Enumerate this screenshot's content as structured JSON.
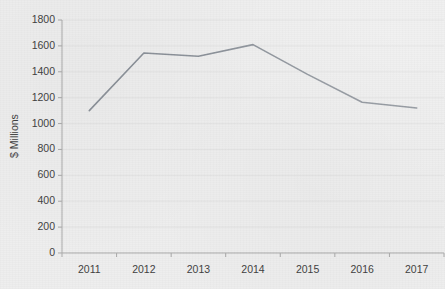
{
  "chart_data": {
    "type": "line",
    "title": "",
    "xlabel": "",
    "ylabel": "$ Millions",
    "categories": [
      "2011",
      "2012",
      "2013",
      "2014",
      "2015",
      "2016",
      "2017"
    ],
    "values": [
      1100,
      1545,
      1520,
      1610,
      1380,
      1165,
      1120
    ],
    "series": [
      {
        "name": "",
        "values": [
          1100,
          1545,
          1520,
          1610,
          1380,
          1165,
          1120
        ]
      }
    ],
    "ylim": [
      0,
      1800
    ],
    "ytick_labels": [
      "1800",
      "1600",
      "1400",
      "1200",
      "1000",
      "800",
      "600",
      "400",
      "200",
      "0"
    ],
    "ytick_values": [
      1800,
      1600,
      1400,
      1200,
      1000,
      800,
      600,
      400,
      200,
      0
    ],
    "ytick_step": 200,
    "xtick_labels": [
      "2011",
      "2012",
      "2013",
      "2014",
      "2015",
      "2016",
      "2017"
    ],
    "grid": "horizontal",
    "legend": "none",
    "markers": "none",
    "line_color": "#8b9199",
    "grid_color": "#e3e3e3",
    "axis_color": "#a9a9a9",
    "text_color": "#3f3f3f",
    "background_color": "#eeeeee"
  }
}
